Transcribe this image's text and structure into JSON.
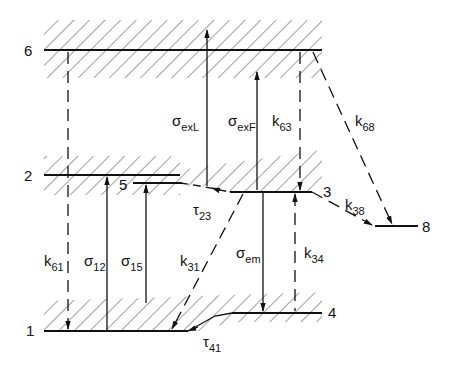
{
  "diagram": {
    "type": "energy-level-scheme",
    "colors": {
      "line": "#111111",
      "background": "#ffffff"
    },
    "levels": [
      {
        "id": "6",
        "label": "6"
      },
      {
        "id": "2",
        "label": "2"
      },
      {
        "id": "5",
        "label": "5"
      },
      {
        "id": "3",
        "label": "3"
      },
      {
        "id": "8",
        "label": "8"
      },
      {
        "id": "1",
        "label": "1"
      },
      {
        "id": "4",
        "label": "4"
      }
    ],
    "transitions": [
      {
        "id": "k61",
        "sym": "k",
        "sub": "61",
        "style": "dashed",
        "from": "6",
        "to": "1"
      },
      {
        "id": "s12",
        "sym": "σ",
        "sub": "12",
        "style": "solid",
        "from": "1",
        "to": "2"
      },
      {
        "id": "s15",
        "sym": "σ",
        "sub": "15",
        "style": "solid",
        "from": "1",
        "to": "5"
      },
      {
        "id": "sexL",
        "sym": "σ",
        "sub": "exL",
        "style": "solid",
        "from": "2",
        "to": "6"
      },
      {
        "id": "sexF",
        "sym": "σ",
        "sub": "exF",
        "style": "solid",
        "from": "3",
        "to": "6"
      },
      {
        "id": "k63",
        "sym": "k",
        "sub": "63",
        "style": "dashed",
        "from": "6",
        "to": "3"
      },
      {
        "id": "k68",
        "sym": "k",
        "sub": "68",
        "style": "dashed",
        "from": "6",
        "to": "8"
      },
      {
        "id": "t23",
        "sym": "τ",
        "sub": "23",
        "style": "solid",
        "from": "2",
        "to": "3"
      },
      {
        "id": "k31",
        "sym": "k",
        "sub": "31",
        "style": "dashed",
        "from": "3",
        "to": "1"
      },
      {
        "id": "sem",
        "sym": "σ",
        "sub": "em",
        "style": "solid",
        "from": "3",
        "to": "4"
      },
      {
        "id": "k34",
        "sym": "k",
        "sub": "34",
        "style": "dashed",
        "from": "4",
        "to": "3"
      },
      {
        "id": "k38",
        "sym": "k",
        "sub": "38",
        "style": "dashed",
        "from": "3",
        "to": "8"
      },
      {
        "id": "t41",
        "sym": "τ",
        "sub": "41",
        "style": "solid",
        "from": "4",
        "to": "1"
      }
    ]
  }
}
